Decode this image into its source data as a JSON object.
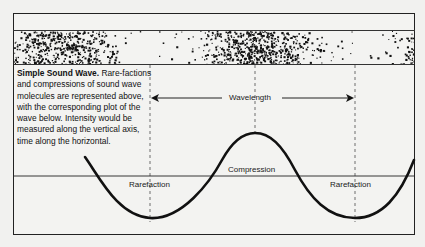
{
  "caption": {
    "title": "Simple Sound Wave.",
    "body": " Rare-factions and compressions of sound wave molecules are represented above, with the corresponding plot of the wave below. Intensity would be measured along the vertical axis, time along the horizontal."
  },
  "labels": {
    "wavelength": "Wavelength",
    "compression": "Compression",
    "rarefaction_left": "Rarefaction",
    "rarefaction_right": "Rarefaction"
  },
  "colors": {
    "ink": "#111111",
    "paper": "#f3f3f1"
  }
}
